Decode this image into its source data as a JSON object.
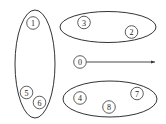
{
  "diagram": {
    "colors": {
      "stroke": "#333333",
      "background": "#ffffff"
    },
    "groups": [
      {
        "id": "group-left",
        "nodes": [
          "1",
          "5",
          "6"
        ]
      },
      {
        "id": "group-top",
        "nodes": [
          "3",
          "2"
        ]
      },
      {
        "id": "group-bottom",
        "nodes": [
          "4",
          "8",
          "7"
        ]
      }
    ],
    "nodes": {
      "n0": "0",
      "n1": "1",
      "n2": "2",
      "n3": "3",
      "n4": "4",
      "n5": "5",
      "n6": "6",
      "n7": "7",
      "n8": "8"
    },
    "arrow": {
      "from": "0",
      "direction": "right"
    }
  }
}
